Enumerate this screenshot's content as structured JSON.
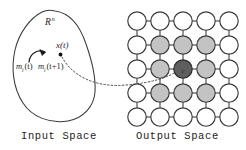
{
  "figure": {
    "background_color": "#ffffff",
    "stroke_color": "#3a3a3a"
  },
  "input_space": {
    "region_label": "R",
    "region_exponent": "n",
    "sample_label": "x(t)",
    "weight_label_before": "m",
    "weight_sub_before": "i",
    "weight_time_before": "(t)",
    "weight_label_after": "m",
    "weight_sub_after": "i",
    "weight_time_after": "(t+1)",
    "caption": "Input Space",
    "blob_fill": "#ffffff",
    "blob_stroke": "#3a3a3a",
    "point_color": "#111111",
    "arrow_color": "#1a1a1a"
  },
  "output_space": {
    "caption": "Output Space",
    "grid_rows": 5,
    "grid_cols": 5,
    "node_radius": 9.2,
    "node_fill_default": "#ffffff",
    "node_fill_neighbor": "#c3c3c3",
    "node_fill_winner": "#5e5e5e",
    "node_stroke": "#3a3a3a",
    "link_color": "#4a4a4a",
    "winner_label": "c",
    "winner_label_color": "#1b1b1b",
    "winner_row": 2,
    "winner_col": 2,
    "neighbor_cells": [
      [
        1,
        1
      ],
      [
        1,
        2
      ],
      [
        1,
        3
      ],
      [
        2,
        1
      ],
      [
        2,
        3
      ],
      [
        3,
        1
      ],
      [
        3,
        2
      ],
      [
        3,
        3
      ]
    ]
  },
  "connector": {
    "style": "dotted",
    "color": "#4d4d4d",
    "label": "mapping-from-sample-to-winner-node"
  }
}
